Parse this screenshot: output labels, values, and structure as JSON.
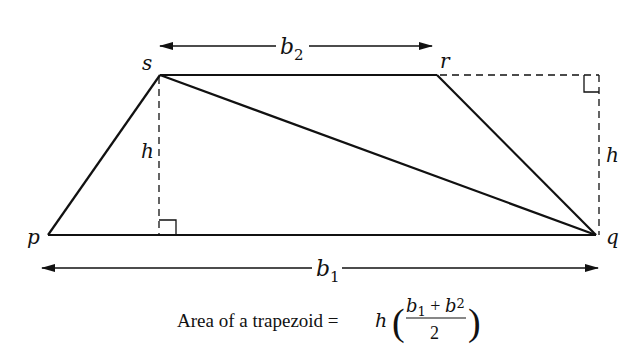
{
  "diagram": {
    "vertices": {
      "s": "s",
      "r": "r",
      "p": "p",
      "q": "q"
    },
    "labels": {
      "b2": "b",
      "b2_sub": "2",
      "b1": "b",
      "b1_sub": "1",
      "h_left": "h",
      "h_right": "h"
    },
    "caption": {
      "text": "Area of a trapezoid = ",
      "h": "h",
      "num_b1": "b",
      "num_b1_sub": "1",
      "plus": " + ",
      "num_b2": "b",
      "num_b2_sub": "2",
      "den": "2",
      "lparen": "(",
      "rparen": ")"
    },
    "colors": {
      "stroke": "#111111",
      "background": "#ffffff"
    }
  }
}
